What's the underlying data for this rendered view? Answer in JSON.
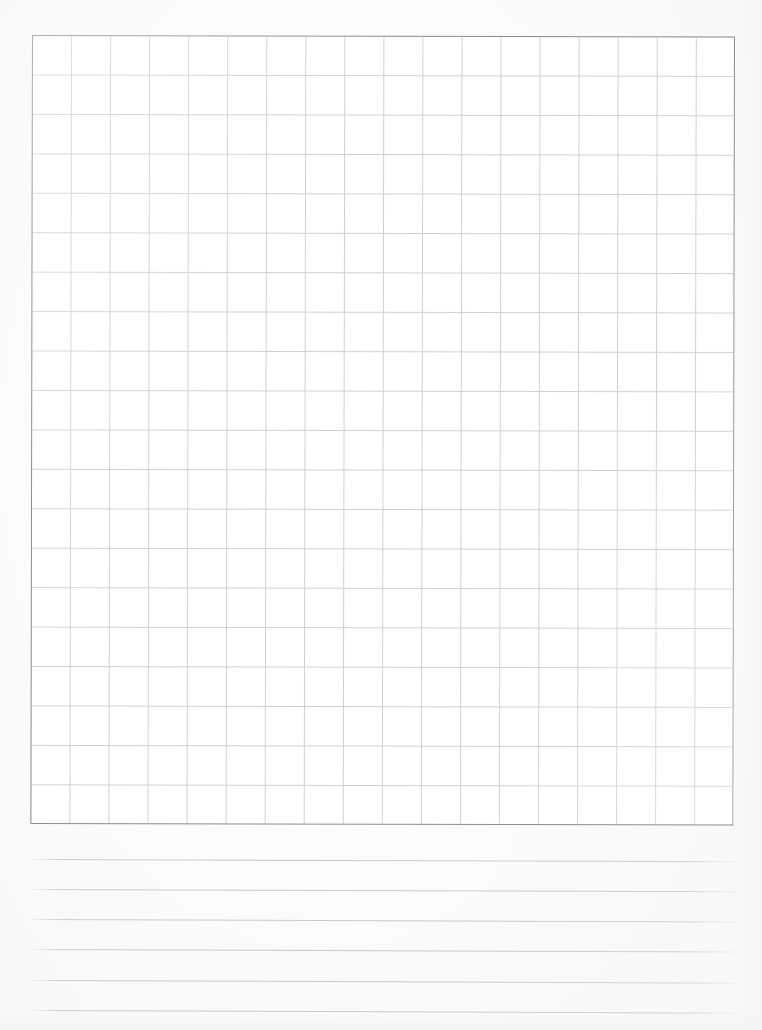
{
  "page": {
    "kind": "scanned-worksheet",
    "width": 762,
    "height": 1030,
    "background_color": "#fdfdfd"
  },
  "grid": {
    "name": "graph-paper-grid",
    "columns": 18,
    "rows": 20,
    "left": 32,
    "top": 35,
    "width": 703,
    "height": 789,
    "cell_width": 39.05,
    "cell_height": 39.45,
    "line_color": "#cfcfd2",
    "border_color": "#8c8c90",
    "fill_color": "#ffffff",
    "content": ""
  },
  "ruled_lines": {
    "name": "ruled-writing-lines",
    "count": 6,
    "left": 33,
    "right": 739,
    "line_color": "#c9c9ce",
    "spacing": 30.2,
    "items": [
      {
        "index": 1,
        "y": 859,
        "skew_deg": 0.18
      },
      {
        "index": 2,
        "y": 889,
        "skew_deg": 0.18
      },
      {
        "index": 3,
        "y": 919,
        "skew_deg": 0.2
      },
      {
        "index": 4,
        "y": 949,
        "skew_deg": 0.2
      },
      {
        "index": 5,
        "y": 980,
        "skew_deg": 0.22
      },
      {
        "index": 6,
        "y": 1010,
        "skew_deg": 0.22
      }
    ]
  },
  "chart_data": {
    "type": "table",
    "title": "",
    "xlabel": "",
    "ylabel": "",
    "categories": [],
    "values": [],
    "grid": true,
    "legend": "none",
    "note": "Empty 18x20 grid — no plotted data present in the image"
  }
}
